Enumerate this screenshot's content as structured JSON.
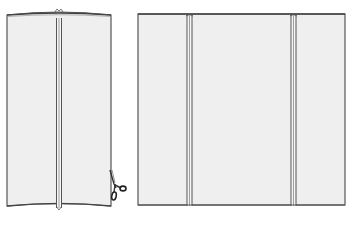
{
  "figure": {
    "description": "Line illustration of a fabric panel with two seams: shown rolled into a tube on the left (with scissors cutting at the bottom right edge) and laid flat on the right",
    "colors": {
      "fill": "#efefef",
      "stroke": "#555555",
      "seam_stroke": "#666666",
      "background": "#ffffff"
    },
    "left_tube": {
      "label": "rolled-tube",
      "seam_count": 1,
      "has_scissors": true
    },
    "right_panel": {
      "label": "flat-panel",
      "seam_count": 2
    },
    "icons": [
      "scissors-icon"
    ]
  }
}
